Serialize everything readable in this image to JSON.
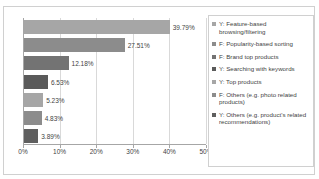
{
  "top_clip_text": "",
  "chart_data": {
    "type": "bar",
    "orientation": "horizontal",
    "title": "",
    "xlabel": "",
    "ylabel": "",
    "xlim": [
      0,
      50
    ],
    "xticks": [
      "0%",
      "10%",
      "20%",
      "30%",
      "40%",
      "50%"
    ],
    "xtick_values": [
      0,
      10,
      20,
      30,
      40,
      50
    ],
    "grid": true,
    "legend_position": "right",
    "categories": [
      "Y: Feature-based browsing/filtering",
      "F: Popularity-based sorting",
      "F: Brand top products",
      "Y: Searching with keywords",
      "Y: Top products",
      "F: Others (e.g. photo related products)",
      "Y: Others (e.g. product's related recommendations)"
    ],
    "values": [
      39.79,
      27.51,
      12.18,
      6.53,
      5.23,
      4.83,
      3.89
    ],
    "data_labels": [
      "39.79%",
      "27.51%",
      "12.18%",
      "6.53%",
      "5.23%",
      "4.83%",
      "3.89%"
    ],
    "colors": [
      "#a6a6a6",
      "#8c8c8c",
      "#737373",
      "#5a5a5a",
      "#a6a6a6",
      "#8c8c8c",
      "#5f5f5f"
    ]
  },
  "legend": {
    "items": [
      {
        "label": "Y: Feature-based browsing/filtering",
        "color": "#a6a6a6"
      },
      {
        "label": "F: Popularity-based sorting",
        "color": "#8c8c8c"
      },
      {
        "label": "F: Brand top products",
        "color": "#737373"
      },
      {
        "label": "Y: Searching with keywords",
        "color": "#5a5a5a"
      },
      {
        "label": "Y: Top products",
        "color": "#a6a6a6"
      },
      {
        "label": "F: Others (e.g. photo related products)",
        "color": "#8c8c8c"
      },
      {
        "label": "Y: Others (e.g. product's related recommendations)",
        "color": "#5f5f5f"
      }
    ]
  }
}
